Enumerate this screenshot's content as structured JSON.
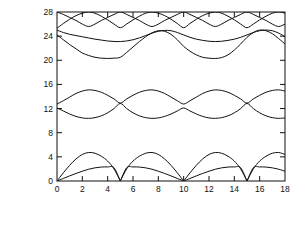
{
  "chart_data": {
    "type": "line",
    "title": "",
    "subtitle": "",
    "xlabel_text": "kh",
    "xlabel_sub": "2",
    "xlabel_rest": ", wave number",
    "ylabel_numerator": "ωh",
    "ylabel_numerator_sub": "2",
    "ylabel_denominator": "v",
    "ylabel_denominator_sub": "1",
    "ylabel_rest": ", Frequency",
    "xlim": [
      0,
      18
    ],
    "ylim": [
      0,
      28
    ],
    "xticks": [
      0,
      2,
      4,
      6,
      8,
      10,
      12,
      14,
      16,
      18
    ],
    "xtick_labels": [
      "0",
      "2",
      "4",
      "6",
      "8",
      "10",
      "12",
      "14",
      "16",
      "18"
    ],
    "yticks": [
      0,
      4,
      8,
      12,
      16,
      20,
      24,
      28
    ],
    "ytick_labels": [
      "0",
      "4",
      "8",
      "12",
      "16",
      "20",
      "24",
      "28"
    ],
    "grid": false,
    "legend": "none",
    "period": 10,
    "line_color": "#111111",
    "frame_color": "#111111",
    "background": "#ffffff",
    "series": [
      {
        "name": "acoustic-branch-1",
        "comment": "lowest branch, zero at k=0,5,10,15; peak ~2.3",
        "x": [
          0,
          0.5,
          1,
          1.5,
          2,
          2.5,
          3,
          3.5,
          4,
          4.5,
          5,
          5.5,
          6,
          6.5,
          7,
          7.5,
          8,
          8.5,
          9,
          9.5,
          10,
          10.5,
          11,
          11.5,
          12,
          12.5,
          13,
          13.5,
          14,
          14.5,
          15,
          15.5,
          16,
          16.5,
          17,
          17.5,
          18
        ],
        "y": [
          0,
          0.42,
          0.85,
          1.25,
          1.62,
          1.95,
          2.18,
          2.31,
          2.33,
          2.2,
          0,
          2.2,
          2.33,
          2.31,
          2.18,
          1.95,
          1.62,
          1.25,
          0.85,
          0.42,
          0,
          0.42,
          0.85,
          1.25,
          1.62,
          1.95,
          2.18,
          2.31,
          2.33,
          2.2,
          0,
          2.2,
          2.33,
          2.31,
          2.18,
          1.95,
          1.62
        ]
      },
      {
        "name": "acoustic-branch-2",
        "comment": "second branch, zero at k=0,5,10,15; peak ~4.7 near k=2.4",
        "x": [
          0,
          0.5,
          1,
          1.5,
          2,
          2.5,
          3,
          3.5,
          4,
          4.5,
          5,
          5.5,
          6,
          6.5,
          7,
          7.5,
          8,
          8.5,
          9,
          9.5,
          10,
          10.5,
          11,
          11.5,
          12,
          12.5,
          13,
          13.5,
          14,
          14.5,
          15,
          15.5,
          16,
          16.5,
          17,
          17.5,
          18
        ],
        "y": [
          0,
          1.35,
          2.6,
          3.65,
          4.4,
          4.72,
          4.6,
          4.1,
          3.3,
          2.0,
          0,
          2.0,
          3.3,
          4.1,
          4.6,
          4.72,
          4.4,
          3.65,
          2.6,
          1.35,
          0,
          1.35,
          2.6,
          3.65,
          4.4,
          4.72,
          4.6,
          4.1,
          3.3,
          2.0,
          0,
          2.0,
          3.3,
          4.1,
          4.6,
          4.72,
          4.4
        ]
      },
      {
        "name": "optical-branch-lower",
        "comment": "lower of the crossing pair; starts ~12.1 at k=0, dips ~10.4 at k=2.5, rises to ~12.9 at k=5",
        "x": [
          0,
          0.5,
          1,
          1.5,
          2,
          2.5,
          3,
          3.5,
          4,
          4.5,
          5,
          5.5,
          6,
          6.5,
          7,
          7.5,
          8,
          8.5,
          9,
          9.5,
          10,
          10.5,
          11,
          11.5,
          12,
          12.5,
          13,
          13.5,
          14,
          14.5,
          15,
          15.5,
          16,
          16.5,
          17,
          17.5,
          18
        ],
        "y": [
          12.1,
          11.6,
          11.1,
          10.7,
          10.45,
          10.38,
          10.5,
          10.8,
          11.3,
          12.0,
          12.85,
          12.0,
          11.3,
          10.8,
          10.5,
          10.38,
          10.45,
          10.7,
          11.1,
          11.6,
          12.1,
          11.6,
          11.1,
          10.7,
          10.45,
          10.38,
          10.5,
          10.8,
          11.3,
          12.0,
          12.85,
          12.0,
          11.3,
          10.8,
          10.5,
          10.38,
          10.45
        ]
      },
      {
        "name": "optical-branch-upper",
        "comment": "upper of the crossing pair; starts ~12.8 at k=0, peaks ~15.1 at k=2.5, dips ~12.8 at k=5",
        "x": [
          0,
          0.5,
          1,
          1.5,
          2,
          2.5,
          3,
          3.5,
          4,
          4.5,
          5,
          5.5,
          6,
          6.5,
          7,
          7.5,
          8,
          8.5,
          9,
          9.5,
          10,
          10.5,
          11,
          11.5,
          12,
          12.5,
          13,
          13.5,
          14,
          14.5,
          15,
          15.5,
          16,
          16.5,
          17,
          17.5,
          18
        ],
        "y": [
          12.75,
          13.3,
          13.9,
          14.5,
          14.9,
          15.1,
          15.0,
          14.7,
          14.2,
          13.6,
          12.9,
          13.6,
          14.2,
          14.7,
          15.0,
          15.1,
          14.9,
          14.5,
          13.9,
          13.3,
          12.75,
          13.3,
          13.9,
          14.5,
          14.9,
          15.1,
          15.0,
          14.7,
          14.2,
          13.6,
          12.9,
          13.6,
          14.2,
          14.7,
          15.0,
          15.1,
          14.9
        ]
      },
      {
        "name": "band-20-lower",
        "comment": "from ~24.2 at k=0 descending to minimum ~20.3 around k=4.7, back up",
        "x": [
          0,
          0.5,
          1,
          1.5,
          2,
          2.5,
          3,
          3.5,
          4,
          4.5,
          5,
          5.5,
          6,
          6.5,
          7,
          7.5,
          8,
          8.5,
          9,
          9.5,
          10,
          10.5,
          11,
          11.5,
          12,
          12.5,
          13,
          13.5,
          14,
          14.5,
          15,
          15.5,
          16,
          16.5,
          17,
          17.5,
          18
        ],
        "y": [
          24.2,
          23.4,
          22.6,
          21.9,
          21.2,
          20.8,
          20.5,
          20.35,
          20.3,
          20.35,
          20.5,
          21.3,
          22.2,
          23.1,
          23.9,
          24.55,
          24.9,
          24.8,
          24.3,
          23.4,
          22.3,
          21.5,
          20.9,
          20.5,
          20.35,
          20.3,
          20.45,
          20.9,
          21.7,
          22.7,
          23.8,
          24.6,
          25.0,
          24.9,
          24.4,
          23.6,
          22.7
        ]
      },
      {
        "name": "band-23-branch",
        "comment": "near-flat band ~25 at k=0 dipping to ~23.1 near k=4-6 then bumping ~24.9 mid-period",
        "x": [
          0,
          0.5,
          1,
          1.5,
          2,
          2.5,
          3,
          3.5,
          4,
          4.5,
          5,
          5.5,
          6,
          6.5,
          7,
          7.5,
          8,
          8.5,
          9,
          9.5,
          10,
          10.5,
          11,
          11.5,
          12,
          12.5,
          13,
          13.5,
          14,
          14.5,
          15,
          15.5,
          16,
          16.5,
          17,
          17.5,
          18
        ],
        "y": [
          25.0,
          24.6,
          24.3,
          24.1,
          23.9,
          23.7,
          23.5,
          23.35,
          23.2,
          23.12,
          23.1,
          23.2,
          23.4,
          23.7,
          24.1,
          24.5,
          24.8,
          24.95,
          24.9,
          24.6,
          24.2,
          23.8,
          23.5,
          23.3,
          23.15,
          23.1,
          23.15,
          23.3,
          23.5,
          23.8,
          24.2,
          24.6,
          24.9,
          25.0,
          24.9,
          24.5,
          23.9
        ]
      },
      {
        "name": "band-26-branch",
        "comment": "upper band from ~25.3 at k=0 rising to 28 ceiling, dipping to ~25.4 at k=5,10,15",
        "x": [
          0,
          0.5,
          1,
          1.5,
          2,
          2.5,
          3,
          3.5,
          4,
          4.5,
          5,
          5.5,
          6,
          6.5,
          7,
          7.5,
          8,
          8.5,
          9,
          9.5,
          10,
          10.5,
          11,
          11.5,
          12,
          12.5,
          13,
          13.5,
          14,
          14.5,
          15,
          15.5,
          16,
          16.5,
          17,
          17.5,
          18
        ],
        "y": [
          25.3,
          26.1,
          26.8,
          27.4,
          27.8,
          28.0,
          27.8,
          27.3,
          26.7,
          26.0,
          25.4,
          26.0,
          26.7,
          27.3,
          27.8,
          28.0,
          27.8,
          27.4,
          26.8,
          26.1,
          25.4,
          26.1,
          26.8,
          27.4,
          27.8,
          28.0,
          27.8,
          27.3,
          26.7,
          26.0,
          25.4,
          26.0,
          26.7,
          27.3,
          27.8,
          28.0,
          27.8
        ]
      },
      {
        "name": "band-ceiling-branch",
        "comment": "V-shaped branches touching 28 ceiling, minima ~25.6 at k=2.5,7.5,12.5,17.5",
        "x": [
          0,
          0.5,
          1,
          1.5,
          2,
          2.5,
          3,
          3.5,
          4,
          4.5,
          5,
          5.5,
          6,
          6.5,
          7,
          7.5,
          8,
          8.5,
          9,
          9.5,
          10,
          10.5,
          11,
          11.5,
          12,
          12.5,
          13,
          13.5,
          14,
          14.5,
          15,
          15.5,
          16,
          16.5,
          17,
          17.5,
          18
        ],
        "y": [
          28,
          27.6,
          27.1,
          26.6,
          26.0,
          25.6,
          26.0,
          26.6,
          27.1,
          27.6,
          28,
          27.6,
          27.1,
          26.6,
          26.0,
          25.6,
          26.0,
          26.6,
          27.1,
          27.6,
          28,
          27.6,
          27.1,
          26.6,
          26.0,
          25.6,
          26.0,
          26.6,
          27.1,
          27.6,
          28,
          27.6,
          27.1,
          26.6,
          26.0,
          25.6,
          26.0
        ]
      }
    ]
  },
  "plot_box": {
    "left": 57,
    "top": 12,
    "right": 285,
    "bottom": 181
  }
}
